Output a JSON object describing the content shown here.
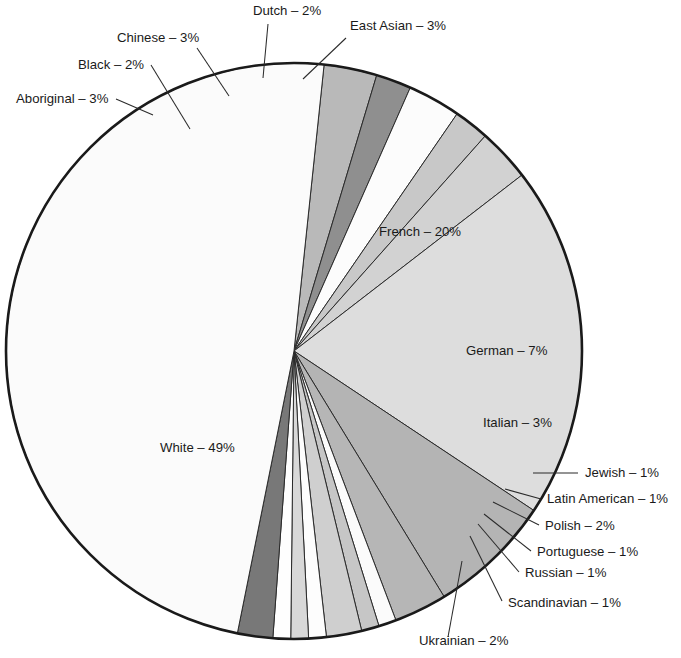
{
  "chart_data": {
    "type": "pie",
    "title": "",
    "subtitle": "",
    "xlabel": "",
    "ylabel": "",
    "legend_position": "none",
    "grid": false,
    "label_format": "{name} – {value}%",
    "total": 100,
    "categories": [
      "Aboriginal",
      "Black",
      "Chinese",
      "Dutch",
      "East Asian",
      "French",
      "German",
      "Italian",
      "Jewish",
      "Latin American",
      "Polish",
      "Portuguese",
      "Russian",
      "Scandinavian",
      "Ukrainian",
      "White"
    ],
    "values": [
      3,
      2,
      3,
      2,
      3,
      20,
      7,
      3,
      1,
      1,
      2,
      1,
      1,
      1,
      2,
      49
    ],
    "slices": [
      {
        "name": "Aboriginal",
        "value": 3,
        "label": "Aboriginal – 3%",
        "color": "#b9b9b9",
        "label_x": 16,
        "label_y": 103,
        "label_anchor": "start",
        "leader": [
          [
            116,
            99
          ],
          [
            153,
            115
          ]
        ]
      },
      {
        "name": "Black",
        "value": 2,
        "label": "Black – 2%",
        "color": "#8f8f8f",
        "label_x": 78,
        "label_y": 69,
        "label_anchor": "start",
        "leader": [
          [
            151,
            65
          ],
          [
            190,
            129
          ]
        ]
      },
      {
        "name": "Chinese",
        "value": 3,
        "label": "Chinese – 3%",
        "color": "#fcfcfc",
        "label_x": 117,
        "label_y": 42,
        "label_anchor": "start",
        "leader": [
          [
            197,
            48
          ],
          [
            229,
            96
          ]
        ]
      },
      {
        "name": "Dutch",
        "value": 2,
        "label": "Dutch – 2%",
        "color": "#c8c8c8",
        "label_x": 253,
        "label_y": 15,
        "label_anchor": "start",
        "leader": [
          [
            268,
            24
          ],
          [
            263,
            78
          ]
        ]
      },
      {
        "name": "East Asian",
        "value": 3,
        "label": "East Asian – 3%",
        "color": "#d2d2d2",
        "label_x": 350,
        "label_y": 30,
        "label_anchor": "start",
        "leader": [
          [
            346,
            38
          ],
          [
            303,
            79
          ]
        ]
      },
      {
        "name": "French",
        "value": 20,
        "label": "French – 20%",
        "color": "#dddddd",
        "label_x": 379,
        "label_y": 236,
        "label_anchor": "start",
        "leader": null
      },
      {
        "name": "German",
        "value": 7,
        "label": "German – 7%",
        "color": "#b4b4b4",
        "label_x": 466,
        "label_y": 355,
        "label_anchor": "start",
        "leader": null
      },
      {
        "name": "Italian",
        "value": 3,
        "label": "Italian – 3%",
        "color": "#b6b6b6",
        "label_x": 483,
        "label_y": 427,
        "label_anchor": "start",
        "leader": null
      },
      {
        "name": "Jewish",
        "value": 1,
        "label": "Jewish – 1%",
        "color": "#fbfbfb",
        "label_x": 585,
        "label_y": 477,
        "label_anchor": "start",
        "leader": [
          [
            578,
            473
          ],
          [
            533,
            473
          ]
        ]
      },
      {
        "name": "Latin American",
        "value": 1,
        "label": "Latin American – 1%",
        "color": "#c6c6c6",
        "label_x": 547,
        "label_y": 503,
        "label_anchor": "start",
        "leader": [
          [
            541,
            499
          ],
          [
            505,
            489
          ]
        ]
      },
      {
        "name": "Polish",
        "value": 2,
        "label": "Polish – 2%",
        "color": "#cfcfcf",
        "label_x": 545,
        "label_y": 530,
        "label_anchor": "start",
        "leader": [
          [
            539,
            525
          ],
          [
            493,
            502
          ]
        ]
      },
      {
        "name": "Portuguese",
        "value": 1,
        "label": "Portuguese – 1%",
        "color": "#fdfdfd",
        "label_x": 537,
        "label_y": 556,
        "label_anchor": "start",
        "leader": [
          [
            531,
            551
          ],
          [
            484,
            514
          ]
        ]
      },
      {
        "name": "Russian",
        "value": 1,
        "label": "Russian – 1%",
        "color": "#d8d8d8",
        "label_x": 525,
        "label_y": 577,
        "label_anchor": "start",
        "leader": [
          [
            519,
            572
          ],
          [
            478,
            524
          ]
        ]
      },
      {
        "name": "Scandinavian",
        "value": 1,
        "label": "Scandinavian – 1%",
        "color": "#fefefe",
        "label_x": 508,
        "label_y": 607,
        "label_anchor": "start",
        "leader": [
          [
            502,
            601
          ],
          [
            470,
            536
          ]
        ]
      },
      {
        "name": "Ukrainian",
        "value": 2,
        "label": "Ukrainian – 2%",
        "color": "#787878",
        "label_x": 419,
        "label_y": 645,
        "label_anchor": "start",
        "leader": [
          [
            448,
            637
          ],
          [
            462,
            561
          ]
        ]
      },
      {
        "name": "White",
        "value": 49,
        "label": "White – 49%",
        "color": "#fbfbfb",
        "label_x": 160,
        "label_y": 452,
        "label_anchor": "start",
        "leader": null
      }
    ],
    "geometry": {
      "center_x": 294,
      "center_y": 351,
      "radius": 288,
      "start_angle_deg": -84
    },
    "colors": {
      "outline": "#1a1a1a",
      "slice_stroke": "#2b2b2b",
      "text": "#1a1a1a",
      "background": "#ffffff"
    }
  }
}
